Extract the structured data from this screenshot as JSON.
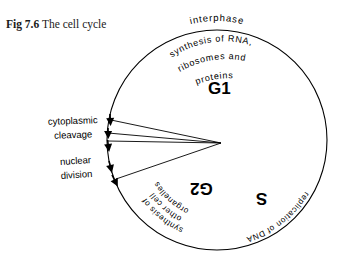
{
  "figure": {
    "caption_number": "Fig 7.6",
    "caption_text": "The cell cycle",
    "background_color": "#ffffff",
    "ink_color": "#000000"
  },
  "diagram": {
    "type": "cell-cycle-circle",
    "circle": {
      "center_x": 217,
      "center_y": 140,
      "radius": 110
    },
    "outer_label": "interphase",
    "phases": [
      {
        "id": "g1",
        "letter": "G1",
        "description_lines": [
          "synthesis of RNA,",
          "ribosomes and",
          "proteins"
        ],
        "orientation": "upright"
      },
      {
        "id": "s",
        "letter": "S",
        "description_lines": [
          "replication of DNA"
        ],
        "orientation": "inverted"
      },
      {
        "id": "g2",
        "letter": "G2",
        "description_lines": [
          "synthesis of",
          "other cell",
          "organelles"
        ],
        "orientation": "inverted"
      }
    ],
    "event_labels": [
      {
        "id": "cytoplasmic-cleavage",
        "lines": [
          "cytoplasmic",
          "cleavage"
        ]
      },
      {
        "id": "nuclear-division",
        "lines": [
          "nuclear",
          "division"
        ]
      }
    ]
  }
}
